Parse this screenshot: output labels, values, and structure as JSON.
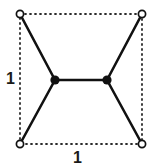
{
  "figure": {
    "type": "geometric-diagram",
    "width": 159,
    "height": 168,
    "background_color": "#ffffff"
  },
  "labels": {
    "left_side": "1",
    "bottom_side": "1"
  },
  "colors": {
    "stroke": "#111111",
    "dotted": "#2b2b2b",
    "node_fill": "#111111",
    "vertex_fill": "#ffffff",
    "text": "#1a1a1a"
  },
  "geometry": {
    "corners": [
      {
        "name": "top-left",
        "x": 20,
        "y": 14
      },
      {
        "name": "top-right",
        "x": 142,
        "y": 14
      },
      {
        "name": "bottom-right",
        "x": 142,
        "y": 144
      },
      {
        "name": "bottom-left",
        "x": 20,
        "y": 144
      }
    ],
    "interior_nodes": [
      {
        "name": "left-node",
        "x": 55,
        "y": 80
      },
      {
        "name": "right-node",
        "x": 107,
        "y": 80
      }
    ],
    "solid_edges": [
      {
        "from": "top-left",
        "to": "left-node"
      },
      {
        "from": "bottom-left",
        "to": "left-node"
      },
      {
        "from": "top-right",
        "to": "right-node"
      },
      {
        "from": "bottom-right",
        "to": "right-node"
      },
      {
        "from": "left-node",
        "to": "right-node"
      }
    ],
    "dotted_edges": [
      {
        "from": "top-left",
        "to": "top-right"
      },
      {
        "from": "top-right",
        "to": "bottom-right"
      },
      {
        "from": "bottom-right",
        "to": "bottom-left"
      },
      {
        "from": "bottom-left",
        "to": "top-left"
      }
    ],
    "vertex_radius": 3.6,
    "node_radius": 4.6,
    "solid_stroke_width": 2.6,
    "dotted_stroke_width": 1.8,
    "dotted_dash_pattern": "1 4"
  }
}
